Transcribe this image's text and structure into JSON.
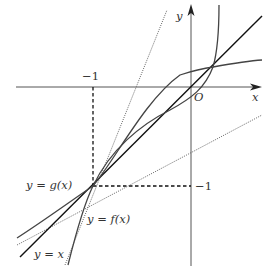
{
  "figure": {
    "axes": {
      "x_label": "x",
      "y_label": "y",
      "origin_label": "O",
      "x_tick_label": "−1",
      "y_tick_label": "−1"
    },
    "curves": [
      {
        "name": "f",
        "label": "y = f(x)",
        "style": "solid"
      },
      {
        "name": "g",
        "label": "y = g(x)",
        "style": "solid"
      },
      {
        "name": "identity",
        "label": "y = x",
        "style": "solid"
      }
    ],
    "tangents": [
      {
        "name": "tangent-f-at-minus-1",
        "style": "dotted"
      },
      {
        "name": "tangent-g-at-minus-1",
        "style": "dotted"
      }
    ],
    "guides": [
      {
        "name": "vertical-guide-x-minus-1",
        "style": "dashed"
      },
      {
        "name": "horizontal-guide-y-minus-1",
        "style": "dashed"
      }
    ],
    "key_points": [
      {
        "label": "(-1, -1)",
        "x": -1,
        "y": -1
      },
      {
        "label": "upper intersection",
        "x": 0.22,
        "y": 0.2
      }
    ],
    "colors": {
      "axis": "#555555",
      "curve": "#444444",
      "identity": "#111111",
      "dotted": "#666666",
      "dashed": "#111111",
      "background": "#ffffff"
    }
  }
}
